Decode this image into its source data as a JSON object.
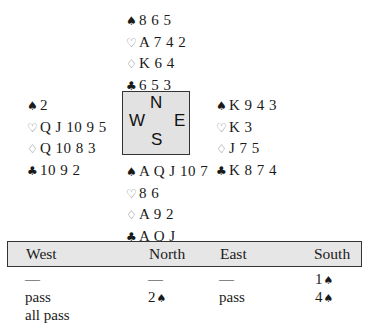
{
  "suits": {
    "spade": "♠",
    "heart": "♡",
    "diamond": "♢",
    "club": "♣"
  },
  "hands": {
    "north": {
      "spades": "8 6 5",
      "hearts": "A 7 4 2",
      "diamonds": "K 6 4",
      "clubs": "6 5 3"
    },
    "west": {
      "spades": "2",
      "hearts": "Q J 10 9 5",
      "diamonds": "Q 10 8 3",
      "clubs": "10 9 2"
    },
    "east": {
      "spades": "K 9 4 3",
      "hearts": "K 3",
      "diamonds": "J 7 5",
      "clubs": "K 8 7 4"
    },
    "south": {
      "spades": "A Q J 10 7",
      "hearts": "8 6",
      "diamonds": "A 9 2",
      "clubs": "A Q J"
    }
  },
  "compass": {
    "n": "N",
    "w": "W",
    "e": "E",
    "s": "S"
  },
  "bidding": {
    "headers": [
      "West",
      "North",
      "East",
      "South"
    ],
    "rows": [
      [
        "—",
        "—",
        "—",
        "1"
      ],
      [
        "pass",
        "2",
        "pass",
        "4"
      ],
      [
        "all pass",
        "",
        "",
        ""
      ]
    ],
    "row_suits": [
      [
        "",
        "",
        "",
        "♠"
      ],
      [
        "",
        "♠",
        "",
        "♠"
      ],
      [
        "",
        "",
        "",
        ""
      ]
    ]
  }
}
